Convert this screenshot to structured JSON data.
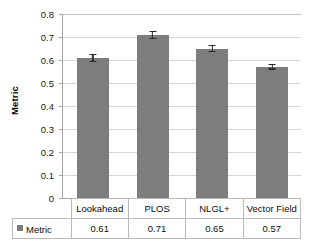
{
  "chart_data": {
    "type": "bar",
    "title": "",
    "xlabel": "",
    "ylabel": "Metric",
    "categories": [
      "Lookahead",
      "PLOS",
      "NLGL+",
      "Vector Field"
    ],
    "values": [
      0.61,
      0.71,
      0.65,
      0.57
    ],
    "errors": [
      0.018,
      0.018,
      0.015,
      0.012
    ],
    "value_labels": [
      "0.61",
      "0.71",
      "0.65",
      "0.57"
    ],
    "series": [
      {
        "name": "Metric",
        "values": [
          0.61,
          0.71,
          0.65,
          0.57
        ]
      }
    ],
    "ylim": [
      0,
      0.8
    ],
    "ytick_values": [
      0,
      0.1,
      0.2,
      0.3,
      0.4,
      0.5,
      0.6,
      0.7,
      0.8
    ],
    "ytick_labels": [
      "0",
      "0.1",
      "0.2",
      "0.3",
      "0.4",
      "0.5",
      "0.6",
      "0.7",
      "0.8"
    ],
    "grid": true,
    "legend_position": "bottom-table",
    "legend_entries": [
      "Metric"
    ],
    "bar_color": "#7d7d7d",
    "gridline_color": "#d6d6d6",
    "axis_color": "#a6a6a6",
    "errorbar_color": "#2b2b2b"
  },
  "data_table": {
    "row_label": "Metric",
    "legend_marker": "square-swatch",
    "headers": [
      "Lookahead",
      "PLOS",
      "NLGL+",
      "Vector Field"
    ],
    "values": [
      "0.61",
      "0.71",
      "0.65",
      "0.57"
    ]
  }
}
